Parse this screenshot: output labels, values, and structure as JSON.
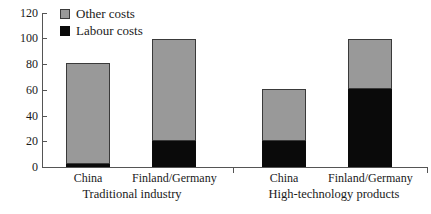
{
  "chart_data": {
    "type": "bar",
    "stacked": true,
    "title": "",
    "xlabel": "",
    "ylabel": "",
    "ylim": [
      0,
      120
    ],
    "yticks": [
      0,
      20,
      40,
      60,
      80,
      100,
      120
    ],
    "ytick_labels": [
      "0",
      "20",
      "40",
      "60",
      "80",
      "100",
      "120"
    ],
    "grid": false,
    "legend_position": "top-left-inside",
    "legend": [
      "Other costs",
      "Labour costs"
    ],
    "colors": {
      "other_costs": "#999999",
      "labour_costs": "#0a0a0a",
      "axis": "#555555",
      "background": "#ffffff"
    },
    "groups": [
      {
        "label": "Traditional industry",
        "categories": [
          "China",
          "Finland/Germany"
        ]
      },
      {
        "label": "High-technology products",
        "categories": [
          "China",
          "Finland/Germany"
        ]
      }
    ],
    "categories": [
      "China",
      "Finland/Germany",
      "China",
      "Finland/Germany"
    ],
    "series": [
      {
        "name": "Labour costs",
        "values": [
          2,
          20,
          20,
          61
        ]
      },
      {
        "name": "Other costs",
        "values": [
          79,
          80,
          41,
          39
        ]
      }
    ],
    "totals": [
      81,
      100,
      61,
      100
    ]
  },
  "axis": {
    "ticks": [
      {
        "label": "120"
      },
      {
        "label": "100"
      },
      {
        "label": "80"
      },
      {
        "label": "60"
      },
      {
        "label": "40"
      },
      {
        "label": "20"
      },
      {
        "label": "0"
      }
    ]
  },
  "legend": {
    "items": [
      {
        "label": "Other costs"
      },
      {
        "label": "Labour costs"
      }
    ]
  },
  "bars": [
    {
      "category": "China",
      "total": 81,
      "labour": 2,
      "other": 79
    },
    {
      "category": "Finland/Germany",
      "total": 100,
      "labour": 20,
      "other": 80
    },
    {
      "category": "China",
      "total": 61,
      "labour": 20,
      "other": 41
    },
    {
      "category": "Finland/Germany",
      "total": 100,
      "labour": 61,
      "other": 39
    }
  ],
  "group_labels": [
    {
      "label": "Traditional industry"
    },
    {
      "label": "High-technology products"
    }
  ]
}
